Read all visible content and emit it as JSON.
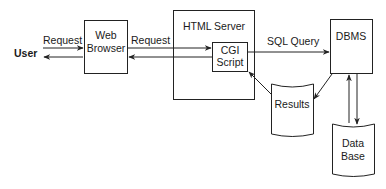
{
  "diagram": {
    "type": "architecture",
    "nodes": {
      "user": {
        "label": "User"
      },
      "web_browser": {
        "line1": "Web",
        "line2": "Browser"
      },
      "html_server": {
        "label": "HTML Server"
      },
      "cgi_script": {
        "line1": "CGI",
        "line2": "Script"
      },
      "dbms": {
        "label": "DBMS"
      },
      "results": {
        "label": "Results"
      },
      "database": {
        "line1": "Data",
        "line2": "Base"
      }
    },
    "edges": {
      "user_to_browser": {
        "label": "Request"
      },
      "browser_to_cgi": {
        "label": "Request"
      },
      "cgi_to_dbms": {
        "label": "SQL Query"
      }
    }
  }
}
